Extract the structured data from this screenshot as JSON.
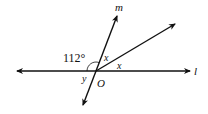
{
  "diagram": {
    "type": "geometry-angles",
    "point": {
      "label": "O",
      "x": 96,
      "y": 71
    },
    "lines": [
      {
        "id": "l",
        "label": "l",
        "from": [
          17,
          71
        ],
        "to": [
          190,
          71
        ]
      },
      {
        "id": "m",
        "label": "m",
        "from": [
          83,
          105
        ],
        "to": [
          117,
          16
        ]
      },
      {
        "id": "ray",
        "label": "",
        "from": [
          96,
          71
        ],
        "to": [
          175,
          24
        ]
      }
    ],
    "angles": [
      {
        "label": "112°",
        "description": "angle between left side of l and upper m"
      },
      {
        "label": "x",
        "description": "angle between m (up) and the ray"
      },
      {
        "label": "x",
        "description": "angle between the ray and right side of l"
      },
      {
        "label": "y",
        "description": "angle between left side of l and lower m"
      }
    ],
    "labels": {
      "m": "m",
      "l": "l",
      "O": "O",
      "angle112": "112°",
      "x1": "x",
      "x2": "x",
      "y": "y"
    },
    "colors": {
      "stroke": "#111111",
      "background": "#ffffff"
    }
  }
}
